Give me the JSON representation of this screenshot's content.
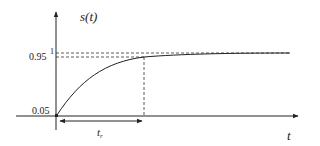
{
  "diagram": {
    "y_axis_label": "s(t)",
    "x_axis_label": "t",
    "level_labels": {
      "one": "1",
      "ninety_five": "0.95",
      "five": "0.05"
    },
    "rise_time_label": "t",
    "rise_time_subscript": "r",
    "colors": {
      "line": "#222222",
      "background": "#ffffff"
    }
  }
}
